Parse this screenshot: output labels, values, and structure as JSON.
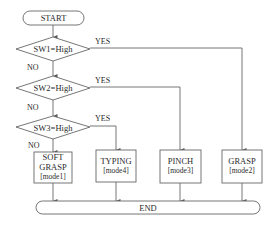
{
  "diagram": {
    "type": "flowchart",
    "start": {
      "label": "START"
    },
    "end": {
      "label": "END"
    },
    "decisions": [
      {
        "id": "sw1",
        "label": "SW1=High",
        "yes_label": "YES",
        "no_label": "NO",
        "yes_target": "grasp"
      },
      {
        "id": "sw2",
        "label": "SW2=High",
        "yes_label": "YES",
        "no_label": "NO",
        "yes_target": "pinch"
      },
      {
        "id": "sw3",
        "label": "SW3=High",
        "yes_label": "YES",
        "no_label": "NO",
        "yes_target": "typing",
        "no_target": "soft_grasp"
      }
    ],
    "processes": [
      {
        "id": "soft_grasp",
        "line1": "SOFT",
        "line2": "GRASP",
        "mode": "[mode1]"
      },
      {
        "id": "typing",
        "line1": "TYPING",
        "mode": "[mode4]"
      },
      {
        "id": "pinch",
        "line1": "PINCH",
        "mode": "[mode3]"
      },
      {
        "id": "grasp",
        "line1": "GRASP",
        "mode": "[mode2]"
      }
    ],
    "colors": {
      "line": "#555555",
      "text": "#2a2a2a",
      "background": "#ffffff"
    }
  }
}
